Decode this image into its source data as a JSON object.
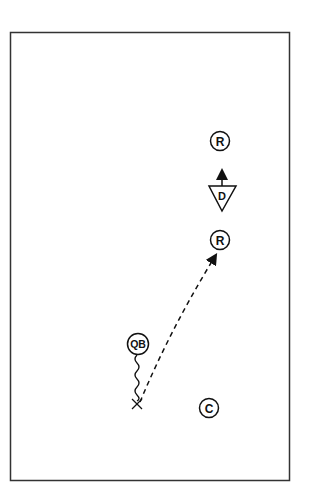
{
  "diagram": {
    "type": "football-play",
    "players": {
      "receiver_deep": {
        "label": "R"
      },
      "defender": {
        "label": "D"
      },
      "receiver_short": {
        "label": "R"
      },
      "quarterback": {
        "label": "QB"
      },
      "center": {
        "label": "C"
      }
    },
    "markers": {
      "dropback_point": {
        "symbol": "×"
      }
    },
    "routes": {
      "qb_dropback": {
        "style": "wavy"
      },
      "pass": {
        "style": "dashed",
        "arrow": true
      },
      "defender_move": {
        "style": "solid",
        "arrow": true
      }
    },
    "colors": {
      "ink": "#111111",
      "background": "#ffffff",
      "frame": "#333333"
    }
  }
}
